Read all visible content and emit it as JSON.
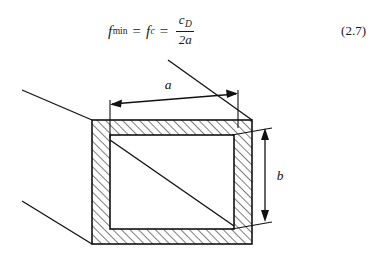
{
  "page": {
    "background_color": "#ffffff",
    "ink_color": "#111111",
    "width": 379,
    "height": 261
  },
  "equation": {
    "number": "(2.7)",
    "lhs_symbol": "f",
    "lhs_subscript": "min",
    "mid_symbol": "f",
    "mid_subscript": "c",
    "equals_1": "=",
    "equals_2": "=",
    "fraction_numerator_symbol": "c",
    "fraction_numerator_subscript": "D",
    "fraction_denominator": "2a",
    "plain_text": "f_min = f_c = c_D / (2a)"
  },
  "figure": {
    "caption": "",
    "type": "rectangular-waveguide-cross-section",
    "dimensions": [
      {
        "name": "a",
        "label": "a",
        "orientation": "horizontal",
        "meaning": "broad inner wall width",
        "arrow_style": "double-headed"
      },
      {
        "name": "b",
        "label": "b",
        "orientation": "vertical",
        "meaning": "narrow inner wall height",
        "arrow_style": "double-headed"
      }
    ],
    "hatching": {
      "pattern": "diagonal-45",
      "spacing_px": 6,
      "color": "#111111"
    },
    "geometry": {
      "outer_rect": {
        "x": 92,
        "y": 62,
        "width": 160,
        "height": 124
      },
      "inner_rect": {
        "x": 110,
        "y": 77,
        "width": 124,
        "height": 94
      },
      "wall_thickness_px": 16,
      "perspective_offset": {
        "dx": -46,
        "dy": 26
      },
      "perspective_lines": 3
    }
  }
}
